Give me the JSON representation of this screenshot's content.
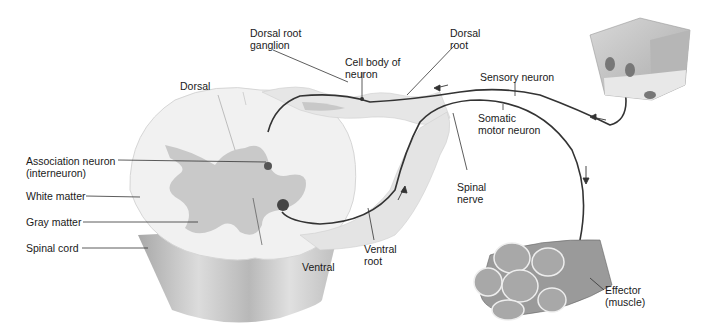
{
  "diagram": {
    "labels": {
      "dorsal_root_ganglion": "Dorsal root\nganglion",
      "cell_body": "Cell body of\nneuron",
      "dorsal_root": "Dorsal\nroot",
      "sensory_neuron": "Sensory neuron",
      "somatic_motor_neuron": "Somatic\nmotor neuron",
      "dorsal": "Dorsal",
      "association_neuron": "Association neuron\n(interneuron)",
      "white_matter": "White matter",
      "gray_matter": "Gray matter",
      "spinal_cord": "Spinal cord",
      "ventral": "Ventral",
      "ventral_root": "Ventral\nroot",
      "spinal_nerve": "Spinal\nnerve",
      "effector": "Effector\n(muscle)"
    },
    "colors": {
      "white_matter": "#f0f0f0",
      "gray_matter": "#c8c8c8",
      "cord_side": "#bdbdbd",
      "nerve_line": "#333333",
      "leader_line": "#333333",
      "muscle": "#8e8e8e"
    },
    "arrows": [
      "arrow-left-dorsal-root",
      "arrow-left-sensory",
      "arrow-up-ventral-root",
      "arrow-down-motor"
    ]
  }
}
